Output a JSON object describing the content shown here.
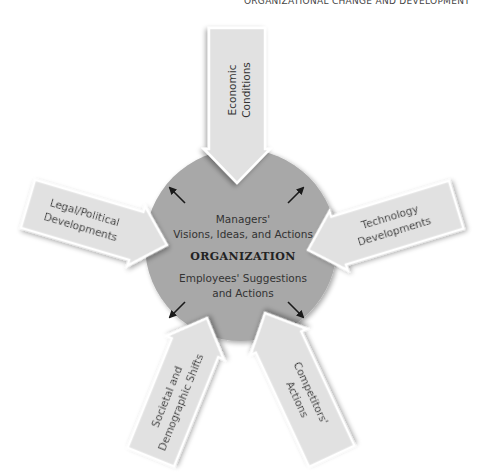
{
  "header": {
    "text": "ORGANIZATIONAL CHANGE AND DEVELOPMENT"
  },
  "colors": {
    "organization_circle": "#a8a8a8",
    "arrow_fill": "#e1e1e1",
    "arrow_stroke": "#ffffff",
    "text": "#333333"
  },
  "organization": {
    "title": "ORGANIZATION",
    "managers_line1": "Managers'",
    "managers_line2": "Visions, Ideas, and Actions",
    "employees_line1": "Employees' Suggestions",
    "employees_line2": "and Actions"
  },
  "forces": [
    {
      "id": "economic",
      "line1": "Economic",
      "line2": "Conditions",
      "position": "top"
    },
    {
      "id": "legal",
      "line1": "Legal/Political",
      "line2": "Developments",
      "position": "left"
    },
    {
      "id": "technology",
      "line1": "Technology",
      "line2": "Developments",
      "position": "right"
    },
    {
      "id": "societal",
      "line1": "Societal and",
      "line2": "Demographic Shifts",
      "position": "bottom-left"
    },
    {
      "id": "competitors",
      "line1": "Competitors'",
      "line2": "Actions",
      "position": "bottom-right"
    }
  ],
  "outward_arrows": [
    "upper-left",
    "upper-right",
    "lower-left",
    "lower-right"
  ]
}
